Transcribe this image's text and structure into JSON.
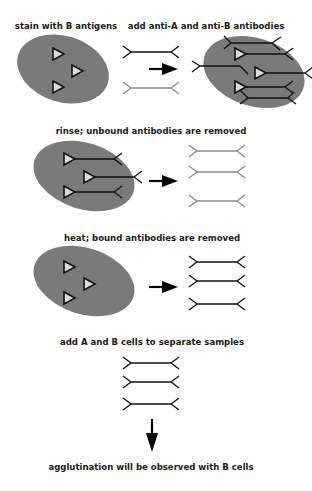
{
  "diagram": {
    "type": "process-flow",
    "steps": [
      {
        "id": 1,
        "label": "stain with B antigens",
        "description": "cell with B antigens (triangles)"
      },
      {
        "id": 2,
        "label": "add anti-A and anti-B antibodies",
        "description": "anti-A (dark) and anti-B (light) antibodies added; anti-B binds to B antigens on cell"
      },
      {
        "id": 3,
        "label": "rinse; unbound antibodies are removed",
        "description": "bound antibodies remain on cell; unbound antibodies washed away"
      },
      {
        "id": 4,
        "label": "heat; bound antibodies are removed",
        "description": "antibodies released from cell"
      },
      {
        "id": 5,
        "label": "add A and B cells to separate samples",
        "description": "released antibodies tested against A and B cells"
      },
      {
        "id": 6,
        "label": "agglutination will be observed with B cells",
        "description": "result"
      }
    ],
    "legend": {
      "cell": "gray ellipse",
      "antigen": "white triangle with dark outline",
      "anti_a_antibody": "dark Y-ended rod",
      "anti_b_antibody": "light gray Y-ended rod"
    },
    "colors": {
      "cell": "#7a7a7a",
      "antigen_fill": "#dcdcdc",
      "anti_a": "#111111",
      "anti_b": "#8a8a8a",
      "arrow": "#000000",
      "background": "#ffffff"
    }
  }
}
